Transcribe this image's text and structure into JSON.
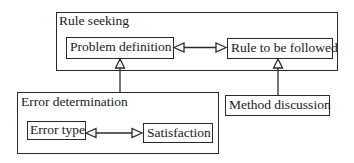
{
  "diagram": {
    "groups": [
      {
        "id": "rule-seeking",
        "label": "Rule seeking"
      },
      {
        "id": "error-determination",
        "label": "Error determination"
      }
    ],
    "nodes": [
      {
        "id": "problem-definition",
        "label": "Problem definition",
        "group": "rule-seeking"
      },
      {
        "id": "rule-to-be-followed",
        "label": "Rule to be followed",
        "group": "rule-seeking"
      },
      {
        "id": "error-type",
        "label": "Error type",
        "group": "error-determination"
      },
      {
        "id": "satisfaction",
        "label": "Satisfaction",
        "group": "error-determination"
      },
      {
        "id": "method-discussion",
        "label": "Method discussion",
        "group": null
      }
    ],
    "edges": [
      {
        "from": "problem-definition",
        "to": "rule-to-be-followed",
        "type": "bidirectional",
        "arrowhead": "hollow-triangle"
      },
      {
        "from": "error-type",
        "to": "satisfaction",
        "type": "bidirectional",
        "arrowhead": "hollow-triangle"
      },
      {
        "from": "error-determination",
        "to": "problem-definition",
        "type": "directed",
        "arrowhead": "hollow-triangle"
      },
      {
        "from": "method-discussion",
        "to": "rule-to-be-followed",
        "type": "directed",
        "arrowhead": "hollow-triangle"
      }
    ],
    "colors": {
      "line": "#2a2a2a",
      "background": "#ffffff",
      "text": "#1a1a1a"
    }
  }
}
